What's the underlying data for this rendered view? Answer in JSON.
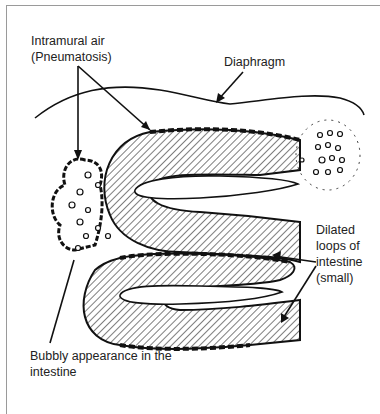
{
  "diagram": {
    "labels": {
      "intramural_line1": "Intramural air",
      "intramural_line2": "(Pneumatosis)",
      "diaphragm": "Diaphragm",
      "dilated_line1": "Dilated",
      "dilated_line2": "loops of",
      "dilated_line3": "intestine",
      "dilated_line4": "(small)",
      "bubbly_line1": "Bubbly appearance in the",
      "bubbly_line2": "intestine"
    },
    "colors": {
      "ink": "#111111",
      "frame": "#9a9a9a",
      "background": "#ffffff"
    }
  }
}
